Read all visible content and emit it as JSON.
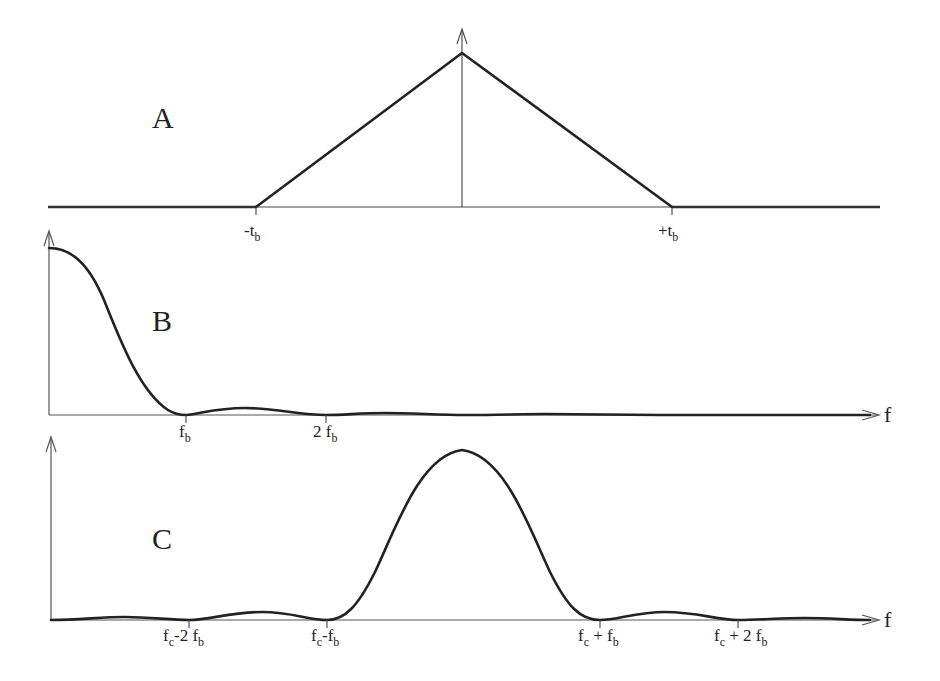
{
  "panels": {
    "a": {
      "label": "A",
      "ticks": [
        {
          "prefix": "-t",
          "sub": "b"
        },
        {
          "prefix": "+t",
          "sub": "b"
        }
      ]
    },
    "b": {
      "label": "B",
      "axis_label": "f",
      "ticks": [
        {
          "prefix": "f",
          "sub": "b"
        },
        {
          "prefix": "2 f",
          "sub": "b"
        }
      ]
    },
    "c": {
      "label": "C",
      "axis_label": "f",
      "ticks": [
        {
          "prefix": "f",
          "sub": "c",
          "mid": "-2 f",
          "sub2": "b"
        },
        {
          "prefix": "f",
          "sub": "c",
          "mid": "-f",
          "sub2": "b"
        },
        {
          "prefix": "f",
          "sub": "c",
          "mid": " + f",
          "sub2": "b"
        },
        {
          "prefix": "f",
          "sub": "c",
          "mid": " + 2 f",
          "sub2": "b"
        }
      ]
    }
  },
  "colors": {
    "line": "#222222",
    "axis": "#555555",
    "background": "#ffffff"
  }
}
